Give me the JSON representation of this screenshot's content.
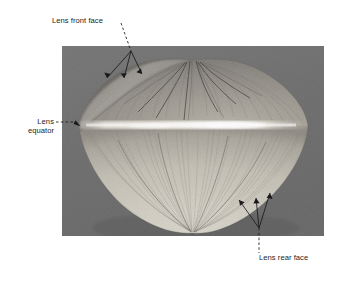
{
  "figure": {
    "type": "annotated-photomicrograph",
    "page_background": "#ffffff",
    "panel": {
      "background": "#6e6e6e",
      "x": 62,
      "y": 46,
      "width": 262,
      "height": 190
    },
    "specimen": {
      "name": "lens",
      "shape": "lentoid",
      "center_x": 193,
      "equator_y": 126,
      "left_x": 79,
      "right_x": 308,
      "top_y": 60,
      "bottom_y": 233,
      "front_face_tone": "#8a8a8a",
      "rear_face_tone": "#cfcbc2",
      "equator_highlight": "#efece4",
      "suture_line_color": "#3a3a3a"
    },
    "annotations": [
      {
        "id": "front-face",
        "label": "Lens front face",
        "leader_style": "dashed-then-three-arrows",
        "arrow_count": 3
      },
      {
        "id": "equator",
        "label_line_1": "Lens",
        "label_line_2": "equator",
        "leader_style": "dashed-single-arrow",
        "arrow_count": 1
      },
      {
        "id": "rear-face",
        "label": "Lens rear face",
        "leader_style": "dashed-then-three-arrows",
        "arrow_count": 3
      }
    ],
    "colors": {
      "text": "#1d1d1d",
      "leader_line": "#1a1a1a"
    }
  }
}
